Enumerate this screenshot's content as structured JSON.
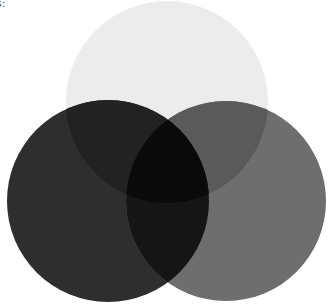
{
  "caption_fragment": "s:",
  "diagram": {
    "type": "venn",
    "sets": [
      {
        "id": "top",
        "label": "",
        "cx": 167,
        "cy": 102,
        "r": 101,
        "color": "#ececec"
      },
      {
        "id": "left",
        "label": "",
        "cx": 108,
        "cy": 201,
        "r": 101,
        "color": "#2e2e2e"
      },
      {
        "id": "right",
        "label": "",
        "cx": 226,
        "cy": 201,
        "r": 100,
        "color": "#6e6e6e"
      }
    ],
    "regions": {
      "top_left": "#222222",
      "top_right": "#5a5a5a",
      "left_right": "#151515",
      "all_three": "#0a0a0a"
    }
  }
}
